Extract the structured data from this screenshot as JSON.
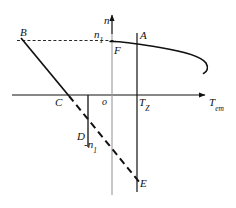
{
  "figure": {
    "background_color": "#ffffff",
    "stroke_color": "#111111",
    "axes": {
      "vertical_label": "n",
      "horizontal_label_main": "T",
      "horizontal_label_sub": "em",
      "origin_label": "o"
    },
    "ticks": [
      {
        "id": "n1",
        "main": "n",
        "sub": "1",
        "prefix": ""
      },
      {
        "id": "neg-n1",
        "main": "n",
        "sub": "1",
        "prefix": "-"
      },
      {
        "id": "TZ",
        "main": "T",
        "sub": "Z",
        "prefix": ""
      }
    ],
    "points": [
      {
        "id": "A",
        "label": "A"
      },
      {
        "id": "B",
        "label": "B"
      },
      {
        "id": "C",
        "label": "C"
      },
      {
        "id": "D",
        "label": "D"
      },
      {
        "id": "E",
        "label": "E"
      },
      {
        "id": "F",
        "label": "F"
      }
    ]
  }
}
